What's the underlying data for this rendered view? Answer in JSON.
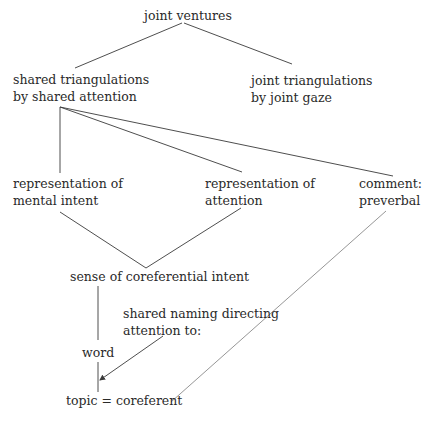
{
  "diagram": {
    "nodes": {
      "joint_ventures": {
        "lines": [
          "joint ventures"
        ]
      },
      "shared_triangulations": {
        "lines": [
          "shared triangulations",
          "by shared attention"
        ]
      },
      "joint_triangulations": {
        "lines": [
          "joint triangulations",
          "by joint gaze"
        ]
      },
      "rep_mental_intent": {
        "lines": [
          "representation of",
          "mental intent"
        ]
      },
      "rep_attention": {
        "lines": [
          "representation of",
          "attention"
        ]
      },
      "comment": {
        "lines": [
          "comment:",
          "preverbal"
        ]
      },
      "sense_coreferential": {
        "lines": [
          "sense of coreferential intent"
        ]
      },
      "shared_naming": {
        "lines": [
          "shared naming directing",
          "attention to:"
        ]
      },
      "word": {
        "lines": [
          "word"
        ]
      },
      "topic": {
        "lines": [
          "topic = coreferent"
        ]
      }
    },
    "edges": [
      {
        "from": "joint ventures",
        "to": "shared triangulations by shared attention"
      },
      {
        "from": "joint ventures",
        "to": "joint triangulations by joint gaze"
      },
      {
        "from": "shared triangulations by shared attention",
        "to": "representation of mental intent"
      },
      {
        "from": "shared triangulations by shared attention",
        "to": "representation of attention"
      },
      {
        "from": "shared triangulations by shared attention",
        "to": "comment: preverbal"
      },
      {
        "from": "representation of mental intent",
        "to": "sense of coreferential intent"
      },
      {
        "from": "representation of attention",
        "to": "sense of coreferential intent"
      },
      {
        "from": "sense of coreferential intent",
        "to": "word"
      },
      {
        "from": "word",
        "to": "topic = coreferent"
      },
      {
        "from": "shared naming directing attention to:",
        "to": "topic = coreferent",
        "arrow": true
      },
      {
        "from": "comment: preverbal",
        "to": "topic = coreferent"
      }
    ],
    "colors": {
      "line": "#3a3a3a",
      "light_line": "#8a8a8a",
      "text": "#2a2a2a",
      "background": "#ffffff"
    }
  }
}
